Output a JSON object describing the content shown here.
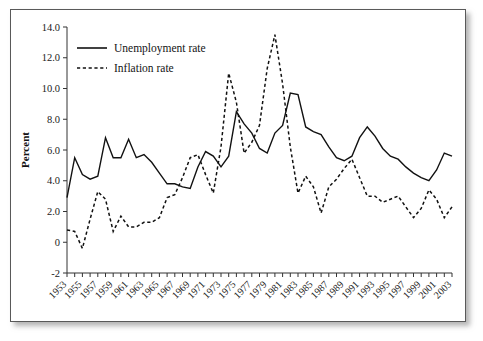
{
  "figure": {
    "frame_color": "#595959",
    "background": "#ffffff"
  },
  "chart_data": {
    "type": "line",
    "title": "",
    "xlabel": "",
    "ylabel": "Percent",
    "xlim": [
      1953,
      2003
    ],
    "ylim": [
      -2,
      14
    ],
    "ytick_values": [
      14,
      12,
      10,
      8,
      6,
      4,
      2,
      0,
      -2
    ],
    "ytick_labels": [
      "14.0",
      "12.0",
      "10.0",
      "8.0",
      "6.0",
      "4.0",
      "2.0",
      "0",
      "-2"
    ],
    "grid": false,
    "legend_position": "upper-left-inside",
    "x": [
      1953,
      1954,
      1955,
      1956,
      1957,
      1958,
      1959,
      1960,
      1961,
      1962,
      1963,
      1964,
      1965,
      1966,
      1967,
      1968,
      1969,
      1970,
      1971,
      1972,
      1973,
      1974,
      1975,
      1976,
      1977,
      1978,
      1979,
      1980,
      1981,
      1982,
      1983,
      1984,
      1985,
      1986,
      1987,
      1988,
      1989,
      1990,
      1991,
      1992,
      1993,
      1994,
      1995,
      1996,
      1997,
      1998,
      1999,
      2000,
      2001,
      2002,
      2003
    ],
    "xtick_labels": [
      "1953",
      "1955",
      "1957",
      "1959",
      "1961",
      "1963",
      "1965",
      "1967",
      "1969",
      "1971",
      "1973",
      "1975",
      "1977",
      "1979",
      "1981",
      "1983",
      "1985",
      "1987",
      "1989",
      "1991",
      "1993",
      "1995",
      "1997",
      "1999",
      "2001",
      "2003"
    ],
    "xtick_label_step": 2,
    "series": [
      {
        "name": "Unemployment rate",
        "style": "solid",
        "color": "#111111",
        "values": [
          2.9,
          5.5,
          4.4,
          4.1,
          4.3,
          6.8,
          5.5,
          5.5,
          6.7,
          5.5,
          5.7,
          5.2,
          4.5,
          3.8,
          3.8,
          3.6,
          3.5,
          4.9,
          5.9,
          5.6,
          4.9,
          5.6,
          8.5,
          7.7,
          7.1,
          6.1,
          5.8,
          7.1,
          7.6,
          9.7,
          9.6,
          7.5,
          7.2,
          7.0,
          6.2,
          5.5,
          5.3,
          5.6,
          6.8,
          7.5,
          6.9,
          6.1,
          5.6,
          5.4,
          4.9,
          4.5,
          4.2,
          4.0,
          4.7,
          5.8,
          5.6
        ]
      },
      {
        "name": "Inflation rate",
        "style": "dashed",
        "color": "#111111",
        "values": [
          0.8,
          0.7,
          -0.4,
          1.5,
          3.3,
          2.8,
          0.7,
          1.7,
          1.0,
          1.0,
          1.3,
          1.3,
          1.6,
          2.9,
          3.1,
          4.2,
          5.5,
          5.7,
          4.4,
          3.2,
          6.2,
          11.0,
          9.1,
          5.8,
          6.5,
          7.6,
          11.3,
          13.5,
          10.3,
          6.2,
          3.2,
          4.3,
          3.6,
          1.9,
          3.6,
          4.1,
          4.8,
          5.4,
          4.2,
          3.0,
          3.0,
          2.6,
          2.8,
          3.0,
          2.3,
          1.6,
          2.2,
          3.4,
          2.8,
          1.6,
          2.3
        ]
      }
    ]
  },
  "legend": {
    "entries": [
      {
        "label": "Unemployment rate",
        "style": "solid"
      },
      {
        "label": "Inflation rate",
        "style": "dashed"
      }
    ]
  },
  "axis": {
    "y_title": "Percent"
  }
}
